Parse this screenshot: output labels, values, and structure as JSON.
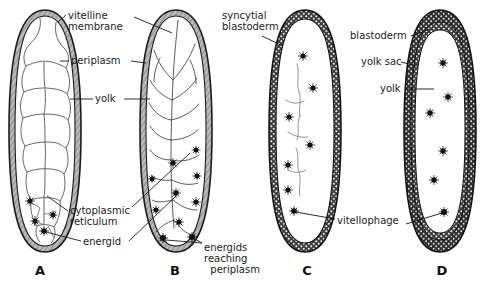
{
  "figure": {
    "type": "biological-diagram",
    "background_color": "#ffffff",
    "ink_color": "#1a1a1a",
    "shell_fill": "#9a9a9a",
    "blastoderm_fill": "#3a3a3a"
  },
  "panels": [
    {
      "letter": "A",
      "caption_x": 40,
      "caption_y": 266,
      "description": "Egg with vitelline membrane, periplasm, yolk, cytoplasmic reticulum and central energids",
      "energids": 4
    },
    {
      "letter": "B",
      "caption_x": 175,
      "caption_y": 266,
      "description": "Energids migrating outward through the yolk toward the periplasm",
      "energids": 10
    },
    {
      "letter": "C",
      "caption_x": 307,
      "caption_y": 266,
      "description": "Syncytial blastoderm formed at the periphery, vitellophages remain in yolk",
      "energids": 7
    },
    {
      "letter": "D",
      "caption_x": 442,
      "caption_y": 266,
      "description": "Cellular blastoderm with yolk sac enclosing yolk and vitellophages",
      "energids": 6
    }
  ],
  "labels": [
    {
      "id": "vitelline-membrane",
      "text": "vitelline\nmembrane",
      "x": 68,
      "y": 10,
      "align": "left"
    },
    {
      "id": "periplasm",
      "text": "periplasm",
      "x": 71,
      "y": 57,
      "align": "left"
    },
    {
      "id": "yolk-left",
      "text": "yolk",
      "x": 95,
      "y": 94,
      "align": "left"
    },
    {
      "id": "cytoplasmic-reticulum",
      "text": "cytoplasmic\nreticulum",
      "x": 70,
      "y": 206,
      "align": "left"
    },
    {
      "id": "energid",
      "text": "energid",
      "x": 83,
      "y": 237,
      "align": "left"
    },
    {
      "id": "energids-reaching-periplasm",
      "text": "energids\nreaching\n  periplasm",
      "x": 204,
      "y": 243,
      "align": "left"
    },
    {
      "id": "syncytial-blastoderm",
      "text": "syncytial\nblastoderm",
      "x": 222,
      "y": 10,
      "align": "left"
    },
    {
      "id": "blastoderm",
      "text": "blastoderm",
      "x": 350,
      "y": 31,
      "align": "left"
    },
    {
      "id": "yolk-sac",
      "text": "yolk sac",
      "x": 361,
      "y": 57,
      "align": "left"
    },
    {
      "id": "yolk-right",
      "text": "yolk",
      "x": 380,
      "y": 84,
      "align": "left"
    },
    {
      "id": "vitellophage",
      "text": "vitellophage",
      "x": 337,
      "y": 216,
      "align": "left"
    }
  ],
  "structures": {
    "egg_a": {
      "label": "egg-a-outline",
      "cx": 45,
      "top": 10,
      "bottom": 252,
      "half_width": 35
    },
    "egg_b": {
      "label": "egg-b-outline",
      "cx": 176,
      "top": 10,
      "bottom": 252,
      "half_width": 36
    },
    "egg_c": {
      "label": "egg-c-outline",
      "cx": 305,
      "top": 10,
      "bottom": 252,
      "half_width": 35
    },
    "egg_d": {
      "label": "egg-d-outline",
      "cx": 440,
      "top": 10,
      "bottom": 252,
      "half_width": 35
    }
  }
}
